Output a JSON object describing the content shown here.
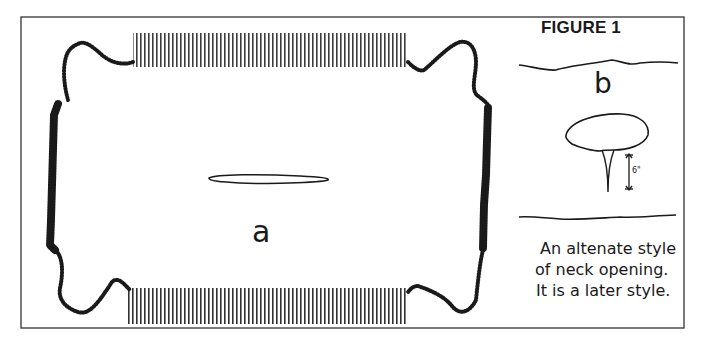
{
  "figure": {
    "title": "FIGURE 1",
    "panel_a": {
      "label": "a",
      "description": "hide with fringed edges and central slit neck opening"
    },
    "panel_b": {
      "label": "b",
      "dimension": "6\"",
      "caption_lines": [
        "An altenate style",
        "of neck opening.",
        "It is a later style."
      ]
    }
  },
  "colors": {
    "ink": "#1a1a1a",
    "background": "#ffffff",
    "frame": "#333333"
  }
}
